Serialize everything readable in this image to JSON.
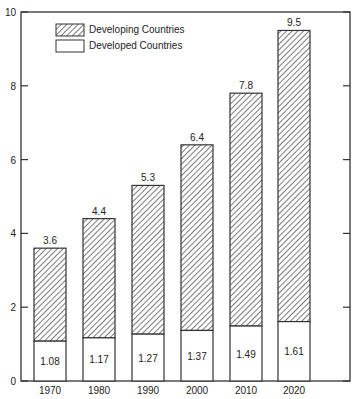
{
  "chart_data": {
    "type": "bar",
    "stacked": true,
    "title": "",
    "xlabel": "",
    "ylabel": "",
    "categories": [
      "1970",
      "1980",
      "1990",
      "2000",
      "2010",
      "2020"
    ],
    "series": [
      {
        "name": "Developed Countries",
        "pattern": "plain",
        "values": [
          1.08,
          1.17,
          1.27,
          1.37,
          1.49,
          1.61
        ]
      },
      {
        "name": "Developing Countries",
        "pattern": "hatched",
        "values": [
          2.52,
          3.23,
          4.03,
          5.03,
          6.31,
          7.89
        ]
      }
    ],
    "totals": [
      3.6,
      4.4,
      5.3,
      6.4,
      7.8,
      9.5
    ],
    "ylim": [
      0,
      10
    ],
    "yticks": [
      0,
      2,
      4,
      6,
      8,
      10
    ],
    "grid": false,
    "legend_position": "upper-left"
  },
  "legend": {
    "items": [
      {
        "label": "Developing Countries",
        "pattern": "hatched"
      },
      {
        "label": "Developed Countries",
        "pattern": "plain"
      }
    ]
  },
  "colors": {
    "stroke": "#333333",
    "background": "#ffffff"
  }
}
